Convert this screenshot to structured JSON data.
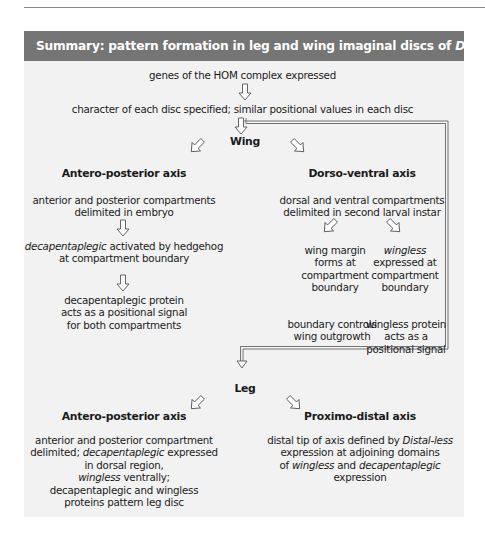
{
  "title": {
    "prefix": "Summary: pattern formation in leg and wing imaginal discs of ",
    "italic": "Drosophila"
  },
  "flow": {
    "step1": "genes of the HOM complex expressed",
    "step2": "character of each disc specified; similar positional values in each disc"
  },
  "wing": {
    "label": "Wing",
    "ap_axis": {
      "heading": "Antero-posterior axis",
      "line1": "anterior and posterior compartments",
      "line2": "delimited in embryo",
      "dpp_italic": "decapentaplegic",
      "dpp_rest": " activated by hedgehog",
      "dpp_line2": "at compartment boundary",
      "signal_line1": "decapentaplegic protein",
      "signal_line2": "acts as a positional signal",
      "signal_line3": "for both compartments"
    },
    "dv_axis": {
      "heading": "Dorso-ventral axis",
      "line1": "dorsal and ventral compartments",
      "line2": "delimited in second larval instar",
      "margin": [
        "wing margin",
        "forms at",
        "compartment",
        "boundary"
      ],
      "wingless_italic": "wingless",
      "wingless_rest": [
        "expressed at",
        "compartment",
        "boundary"
      ],
      "outgrowth": [
        "boundary controls",
        "wing outgrowth"
      ],
      "wg_signal": [
        "wingless protein",
        "acts as a",
        "positional signal"
      ]
    }
  },
  "leg": {
    "label": "Leg",
    "ap_axis": {
      "heading": "Antero-posterior axis",
      "line1": "anterior and posterior compartment",
      "line2_pre": "delimited; ",
      "line2_italic": "decapentaplegic",
      "line2_post": " expressed",
      "line3": "in dorsal region,",
      "line4_italic": "wingless",
      "line4_rest": " ventrally;",
      "line5": "decapentaplegic and wingless",
      "line6": "proteins pattern leg disc"
    },
    "pd_axis": {
      "heading": "Proximo-distal axis",
      "line1_pre": "distal tip of axis defined by ",
      "line1_italic": "Distal-less",
      "line2": "expression at adjoining domains",
      "line3_pre": "of ",
      "line3_italic1": "wingless",
      "line3_mid": " and ",
      "line3_italic2": "decapentaplegic",
      "line4": "expression"
    }
  },
  "colors": {
    "header_bg": "#757575",
    "panel_bg": "#f2f2f2",
    "arrow_stroke": "#555555",
    "arrow_fill": "#ffffff"
  }
}
